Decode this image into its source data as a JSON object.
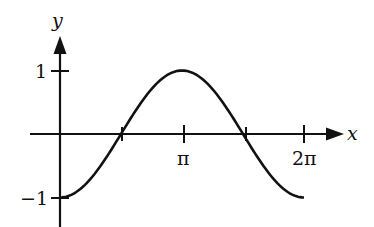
{
  "chart_data": {
    "type": "line",
    "title": "",
    "function": "y = -cos(x)",
    "xlabel": "x",
    "ylabel": "y",
    "x_ticks": [
      {
        "value": 1.5708,
        "label": ""
      },
      {
        "value": 3.1416,
        "label": "π"
      },
      {
        "value": 4.7124,
        "label": ""
      },
      {
        "value": 6.2832,
        "label": "2π"
      }
    ],
    "y_ticks": [
      {
        "value": 1,
        "label": "1"
      },
      {
        "value": -1,
        "label": "−1"
      }
    ],
    "xlim": [
      0,
      6.2832
    ],
    "ylim": [
      -1,
      1
    ],
    "grid": false,
    "legend": null,
    "series": [
      {
        "name": "y = -cos x",
        "x": [
          0,
          0.7854,
          1.5708,
          2.3562,
          3.1416,
          3.927,
          4.7124,
          5.4978,
          6.2832
        ],
        "y": [
          -1,
          -0.707,
          0,
          0.707,
          1,
          0.707,
          0,
          -0.707,
          -1
        ]
      }
    ]
  },
  "labels": {
    "y_axis": "y",
    "x_axis": "x",
    "y_one": "1",
    "y_neg_one": "−1",
    "x_pi": "π",
    "x_two_pi": "2π"
  }
}
